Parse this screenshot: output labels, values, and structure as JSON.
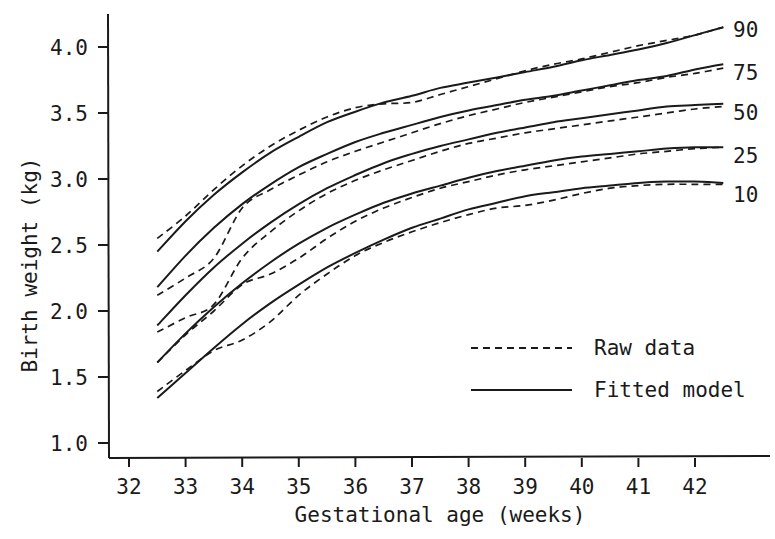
{
  "chart_data": {
    "type": "line",
    "title": "",
    "xlabel": "Gestational age (weeks)",
    "ylabel": "Birth weight (kg)",
    "xlim": [
      31.6,
      43.0
    ],
    "ylim": [
      0.88,
      4.25
    ],
    "xticks": [
      32,
      33,
      34,
      35,
      36,
      37,
      38,
      39,
      40,
      41,
      42
    ],
    "xtick_labels": [
      "32",
      "33",
      "34",
      "35",
      "36",
      "37",
      "38",
      "39",
      "40",
      "41",
      "42"
    ],
    "yticks": [
      1.0,
      1.5,
      2.0,
      2.5,
      3.0,
      3.5,
      4.0
    ],
    "ytick_labels": [
      "1.0",
      "1.5",
      "2.0",
      "2.5",
      "3.0",
      "3.5",
      "4.0"
    ],
    "grid": false,
    "legend": {
      "position": "lower right",
      "entries": [
        {
          "label": "Raw data",
          "style": "dashed"
        },
        {
          "label": "Fitted model",
          "style": "solid"
        }
      ]
    },
    "x": [
      32.5,
      33,
      33.5,
      34,
      34.5,
      35,
      35.5,
      36,
      36.5,
      37,
      37.5,
      38,
      38.5,
      39,
      39.5,
      40,
      40.5,
      41,
      41.5,
      42,
      42.5
    ],
    "series": [
      {
        "name": "90",
        "style": "solid",
        "kind": "Fitted model",
        "values": [
          2.45,
          2.68,
          2.88,
          3.05,
          3.2,
          3.32,
          3.43,
          3.51,
          3.58,
          3.63,
          3.69,
          3.73,
          3.77,
          3.81,
          3.85,
          3.9,
          3.94,
          3.98,
          4.03,
          4.09,
          4.15
        ]
      },
      {
        "name": "90",
        "style": "dashed",
        "kind": "Raw data",
        "values": [
          2.55,
          2.72,
          2.92,
          3.1,
          3.25,
          3.37,
          3.47,
          3.54,
          3.57,
          3.58,
          3.64,
          3.7,
          3.76,
          3.82,
          3.87,
          3.91,
          3.96,
          4.01,
          4.05,
          4.09,
          4.15
        ]
      },
      {
        "name": "75",
        "style": "solid",
        "kind": "Fitted model",
        "values": [
          2.18,
          2.42,
          2.63,
          2.81,
          2.96,
          3.09,
          3.19,
          3.28,
          3.35,
          3.41,
          3.47,
          3.52,
          3.56,
          3.6,
          3.63,
          3.67,
          3.71,
          3.75,
          3.78,
          3.83,
          3.87
        ]
      },
      {
        "name": "75",
        "style": "dashed",
        "kind": "Raw data",
        "values": [
          2.12,
          2.25,
          2.4,
          2.78,
          2.92,
          3.03,
          3.13,
          3.21,
          3.28,
          3.35,
          3.42,
          3.48,
          3.53,
          3.58,
          3.62,
          3.66,
          3.7,
          3.73,
          3.77,
          3.8,
          3.84
        ]
      },
      {
        "name": "50",
        "style": "solid",
        "kind": "Fitted model",
        "values": [
          1.89,
          2.12,
          2.33,
          2.51,
          2.67,
          2.81,
          2.93,
          3.03,
          3.12,
          3.19,
          3.25,
          3.3,
          3.35,
          3.39,
          3.43,
          3.46,
          3.49,
          3.52,
          3.55,
          3.56,
          3.57
        ]
      },
      {
        "name": "50",
        "style": "dashed",
        "kind": "Raw data",
        "values": [
          1.84,
          1.95,
          2.05,
          2.4,
          2.6,
          2.76,
          2.89,
          2.99,
          3.07,
          3.14,
          3.21,
          3.27,
          3.31,
          3.35,
          3.38,
          3.41,
          3.44,
          3.47,
          3.5,
          3.53,
          3.55
        ]
      },
      {
        "name": "25",
        "style": "solid",
        "kind": "Fitted model",
        "values": [
          1.61,
          1.83,
          2.03,
          2.21,
          2.37,
          2.51,
          2.63,
          2.73,
          2.82,
          2.89,
          2.95,
          3.01,
          3.06,
          3.1,
          3.14,
          3.17,
          3.19,
          3.21,
          3.23,
          3.24,
          3.24
        ]
      },
      {
        "name": "25",
        "style": "dashed",
        "kind": "Raw data",
        "values": [
          1.61,
          1.82,
          2.0,
          2.2,
          2.28,
          2.4,
          2.55,
          2.68,
          2.78,
          2.86,
          2.93,
          2.98,
          3.03,
          3.07,
          3.1,
          3.13,
          3.16,
          3.19,
          3.21,
          3.23,
          3.24
        ]
      },
      {
        "name": "10",
        "style": "solid",
        "kind": "Fitted model",
        "values": [
          1.34,
          1.53,
          1.72,
          1.9,
          2.06,
          2.2,
          2.33,
          2.44,
          2.54,
          2.63,
          2.7,
          2.77,
          2.82,
          2.87,
          2.9,
          2.93,
          2.95,
          2.97,
          2.98,
          2.98,
          2.97
        ]
      },
      {
        "name": "10",
        "style": "dashed",
        "kind": "Raw data",
        "values": [
          1.39,
          1.55,
          1.7,
          1.78,
          1.92,
          2.12,
          2.28,
          2.42,
          2.52,
          2.6,
          2.67,
          2.73,
          2.78,
          2.8,
          2.84,
          2.89,
          2.93,
          2.95,
          2.96,
          2.96,
          2.96
        ]
      }
    ],
    "annotations": [
      {
        "text": "90",
        "near": "end of 90th percentile curve"
      },
      {
        "text": "75",
        "near": "end of 75th percentile curve"
      },
      {
        "text": "50",
        "near": "end of 50th percentile curve"
      },
      {
        "text": "25",
        "near": "end of 25th percentile curve"
      },
      {
        "text": "10",
        "near": "end of 10th percentile curve"
      }
    ]
  },
  "labels": {
    "xlabel": "Gestational age (weeks)",
    "ylabel": "Birth weight (kg)",
    "legend_raw": "Raw data",
    "legend_fitted": "Fitted model"
  },
  "colors": {
    "ink": "#1a1a1a",
    "background": "#ffffff"
  }
}
